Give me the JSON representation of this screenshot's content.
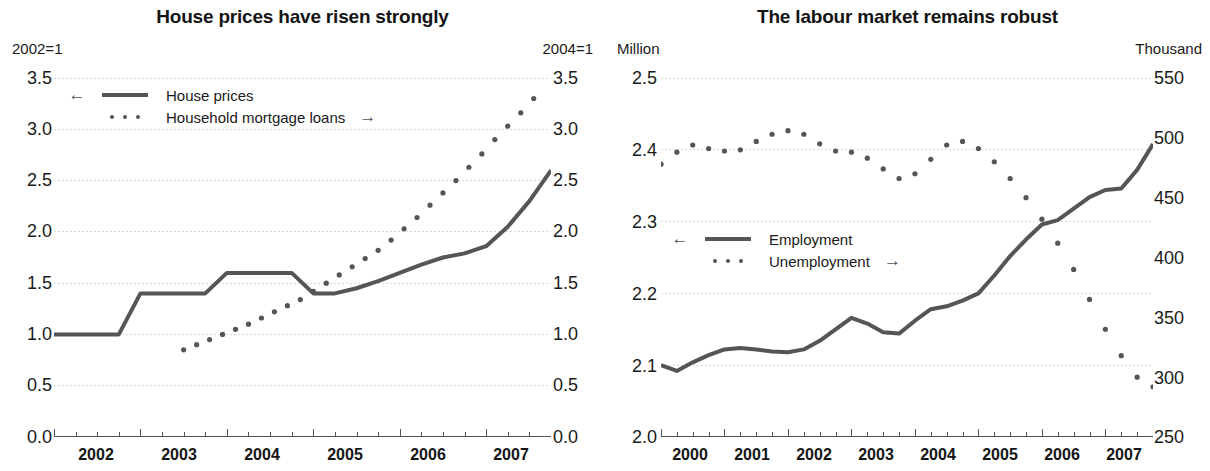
{
  "charts": {
    "left": {
      "title": "House prices have risen strongly",
      "unit_left": "2002=1",
      "unit_right": "2004=1",
      "legend": [
        {
          "label": "House prices",
          "style": "solid",
          "arrow_before": "←",
          "arrow_after": ""
        },
        {
          "label": "Household mortgage loans",
          "style": "dotted",
          "arrow_before": "",
          "arrow_after": "→"
        }
      ],
      "y_ticks_left": [
        "3.5",
        "3.0",
        "2.5",
        "2.0",
        "1.5",
        "1.0",
        "0.5",
        "0.0"
      ],
      "y_ticks_right": [
        "3.5",
        "3.0",
        "2.5",
        "2.0",
        "1.5",
        "1.0",
        "0.5",
        "0.0"
      ],
      "x_ticks": [
        "2002",
        "2003",
        "2004",
        "2005",
        "2006",
        "2007"
      ]
    },
    "right": {
      "title": "The labour market remains robust",
      "unit_left": "Million",
      "unit_right": "Thousand",
      "legend": [
        {
          "label": "Employment",
          "style": "solid",
          "arrow_before": "←",
          "arrow_after": ""
        },
        {
          "label": "Unemployment",
          "style": "dotted",
          "arrow_before": "",
          "arrow_after": "→"
        }
      ],
      "y_ticks_left": [
        "2.5",
        "2.4",
        "2.3",
        "2.2",
        "2.1",
        "2.0"
      ],
      "y_ticks_right": [
        "550",
        "500",
        "450",
        "400",
        "350",
        "300",
        "250"
      ],
      "x_ticks": [
        "2000",
        "2001",
        "2002",
        "2003",
        "2004",
        "2005",
        "2006",
        "2007"
      ]
    }
  },
  "colors": {
    "line": "#555555",
    "grid": "#d9d9d9",
    "axis": "#555555",
    "text": "#1a1a1a"
  },
  "chart_data": [
    {
      "type": "line",
      "id": "house-prices-panel",
      "title": "House prices have risen strongly",
      "xlabel": "",
      "ylabel": "2002=1",
      "ylabel_right": "2004=1",
      "xlim": [
        2002.0,
        2007.75
      ],
      "ylim": [
        0.0,
        3.5
      ],
      "ylim_right": [
        0.0,
        3.5
      ],
      "grid": true,
      "legend_position": "top-left",
      "x_tick_labels": [
        "2002",
        "2003",
        "2004",
        "2005",
        "2006",
        "2007"
      ],
      "y_tick_values": [
        0.0,
        0.5,
        1.0,
        1.5,
        2.0,
        2.5,
        3.0,
        3.5
      ],
      "y_tick_values_right": [
        0.0,
        0.5,
        1.0,
        1.5,
        2.0,
        2.5,
        3.0,
        3.5
      ],
      "series": [
        {
          "name": "House prices",
          "style": "solid",
          "axis": "left",
          "x": [
            2002.0,
            2002.25,
            2002.5,
            2002.75,
            2003.0,
            2003.25,
            2003.5,
            2003.75,
            2004.0,
            2004.25,
            2004.5,
            2004.75,
            2005.0,
            2005.25,
            2005.5,
            2005.75,
            2006.0,
            2006.25,
            2006.5,
            2006.75,
            2007.0,
            2007.25,
            2007.5,
            2007.75
          ],
          "values": [
            1.0,
            1.0,
            1.0,
            1.0,
            1.4,
            1.4,
            1.4,
            1.4,
            1.6,
            1.6,
            1.6,
            1.6,
            1.4,
            1.4,
            1.45,
            1.52,
            1.6,
            1.68,
            1.75,
            1.79,
            1.86,
            2.05,
            2.3,
            2.6
          ]
        },
        {
          "name": "Household mortgage loans",
          "style": "dotted",
          "axis": "right",
          "x": [
            2003.5,
            2003.65,
            2003.8,
            2003.95,
            2004.1,
            2004.25,
            2004.4,
            2004.55,
            2004.7,
            2004.85,
            2005.0,
            2005.15,
            2005.3,
            2005.45,
            2005.6,
            2005.75,
            2005.9,
            2006.05,
            2006.2,
            2006.35,
            2006.5,
            2006.65,
            2006.8,
            2006.95,
            2007.1,
            2007.25,
            2007.4,
            2007.55
          ],
          "values": [
            0.85,
            0.9,
            0.95,
            1.0,
            1.05,
            1.1,
            1.16,
            1.22,
            1.28,
            1.34,
            1.42,
            1.5,
            1.58,
            1.66,
            1.74,
            1.82,
            1.92,
            2.03,
            2.14,
            2.26,
            2.38,
            2.5,
            2.63,
            2.76,
            2.9,
            3.03,
            3.16,
            3.3
          ]
        }
      ]
    },
    {
      "type": "line",
      "id": "labour-market-panel",
      "title": "The labour market remains robust",
      "xlabel": "",
      "ylabel": "Million",
      "ylabel_right": "Thousand",
      "xlim": [
        2000.0,
        2007.75
      ],
      "ylim": [
        2.0,
        2.5
      ],
      "ylim_right": [
        250,
        550
      ],
      "grid": true,
      "legend_position": "middle-left",
      "x_tick_labels": [
        "2000",
        "2001",
        "2002",
        "2003",
        "2004",
        "2005",
        "2006",
        "2007"
      ],
      "y_tick_values": [
        2.0,
        2.1,
        2.2,
        2.3,
        2.4,
        2.5
      ],
      "y_tick_values_right": [
        250,
        300,
        350,
        400,
        450,
        500,
        550
      ],
      "series": [
        {
          "name": "Employment",
          "style": "solid",
          "axis": "left",
          "unit": "Million",
          "x": [
            2000.0,
            2000.25,
            2000.5,
            2000.75,
            2001.0,
            2001.25,
            2001.5,
            2001.75,
            2002.0,
            2002.25,
            2002.5,
            2002.75,
            2003.0,
            2003.25,
            2003.5,
            2003.75,
            2004.0,
            2004.25,
            2004.5,
            2004.75,
            2005.0,
            2005.25,
            2005.5,
            2005.75,
            2006.0,
            2006.25,
            2006.5,
            2006.75,
            2007.0,
            2007.25,
            2007.5,
            2007.75
          ],
          "values": [
            2.1,
            2.092,
            2.104,
            2.114,
            2.122,
            2.124,
            2.122,
            2.119,
            2.118,
            2.122,
            2.134,
            2.15,
            2.166,
            2.158,
            2.146,
            2.144,
            2.162,
            2.178,
            2.182,
            2.19,
            2.2,
            2.225,
            2.252,
            2.275,
            2.296,
            2.302,
            2.318,
            2.334,
            2.344,
            2.346,
            2.372,
            2.408
          ]
        },
        {
          "name": "Unemployment",
          "style": "dotted",
          "axis": "right",
          "unit": "Thousand",
          "x": [
            2000.0,
            2000.25,
            2000.5,
            2000.75,
            2001.0,
            2001.25,
            2001.5,
            2001.75,
            2002.0,
            2002.25,
            2002.5,
            2002.75,
            2003.0,
            2003.25,
            2003.5,
            2003.75,
            2004.0,
            2004.25,
            2004.5,
            2004.75,
            2005.0,
            2005.25,
            2005.5,
            2005.75,
            2006.0,
            2006.25,
            2006.5,
            2006.75,
            2007.0,
            2007.25,
            2007.5,
            2007.75
          ],
          "values": [
            478,
            488,
            494,
            491,
            489,
            490,
            497,
            503,
            506,
            503,
            495,
            489,
            488,
            483,
            474,
            466,
            470,
            482,
            494,
            497,
            491,
            480,
            466,
            450,
            432,
            412,
            390,
            365,
            340,
            318,
            300,
            292
          ]
        }
      ]
    }
  ]
}
